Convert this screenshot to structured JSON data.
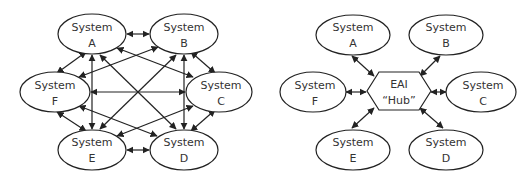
{
  "colors": {
    "stroke": "#222222",
    "text": "#333333",
    "background": "#ffffff"
  },
  "point_to_point": {
    "nodes": [
      {
        "id": "A",
        "line1": "System",
        "line2": "A"
      },
      {
        "id": "B",
        "line1": "System",
        "line2": "B"
      },
      {
        "id": "C",
        "line1": "System",
        "line2": "C"
      },
      {
        "id": "D",
        "line1": "System",
        "line2": "D"
      },
      {
        "id": "E",
        "line1": "System",
        "line2": "E"
      },
      {
        "id": "F",
        "line1": "System",
        "line2": "F"
      }
    ],
    "edges": "all pairs, bidirectional"
  },
  "hub": {
    "center": {
      "line1": "EAI",
      "line2": "“Hub”"
    },
    "nodes": [
      {
        "id": "A",
        "line1": "System",
        "line2": "A"
      },
      {
        "id": "B",
        "line1": "System",
        "line2": "B"
      },
      {
        "id": "C",
        "line1": "System",
        "line2": "C"
      },
      {
        "id": "D",
        "line1": "System",
        "line2": "D"
      },
      {
        "id": "E",
        "line1": "System",
        "line2": "E"
      },
      {
        "id": "F",
        "line1": "System",
        "line2": "F"
      }
    ],
    "edges": "each system to hub, bidirectional"
  }
}
